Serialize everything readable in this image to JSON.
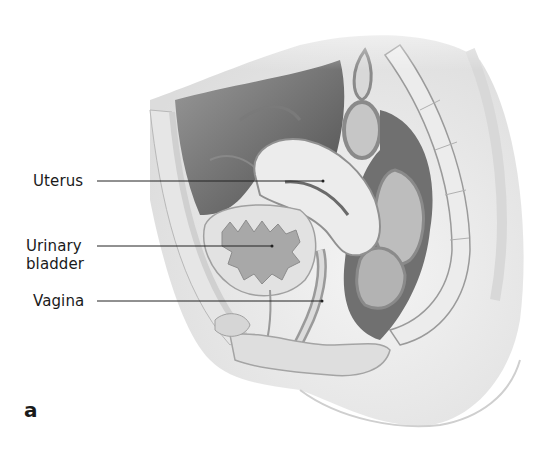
{
  "figure": {
    "panel_letter": "a",
    "labels": [
      {
        "id": "uterus",
        "text": "Uterus"
      },
      {
        "id": "bladder_line1",
        "text": "Urinary"
      },
      {
        "id": "bladder_line2",
        "text": "bladder"
      },
      {
        "id": "vagina",
        "text": "Vagina"
      }
    ],
    "colors": {
      "background": "#ffffff",
      "tissue_light": "#ececec",
      "tissue_mid": "#c8c8c8",
      "cavity_dark": "#6e6e6e",
      "outline": "#8a8a8a",
      "leader_line": "#222222",
      "text": "#1a1a1a"
    }
  }
}
